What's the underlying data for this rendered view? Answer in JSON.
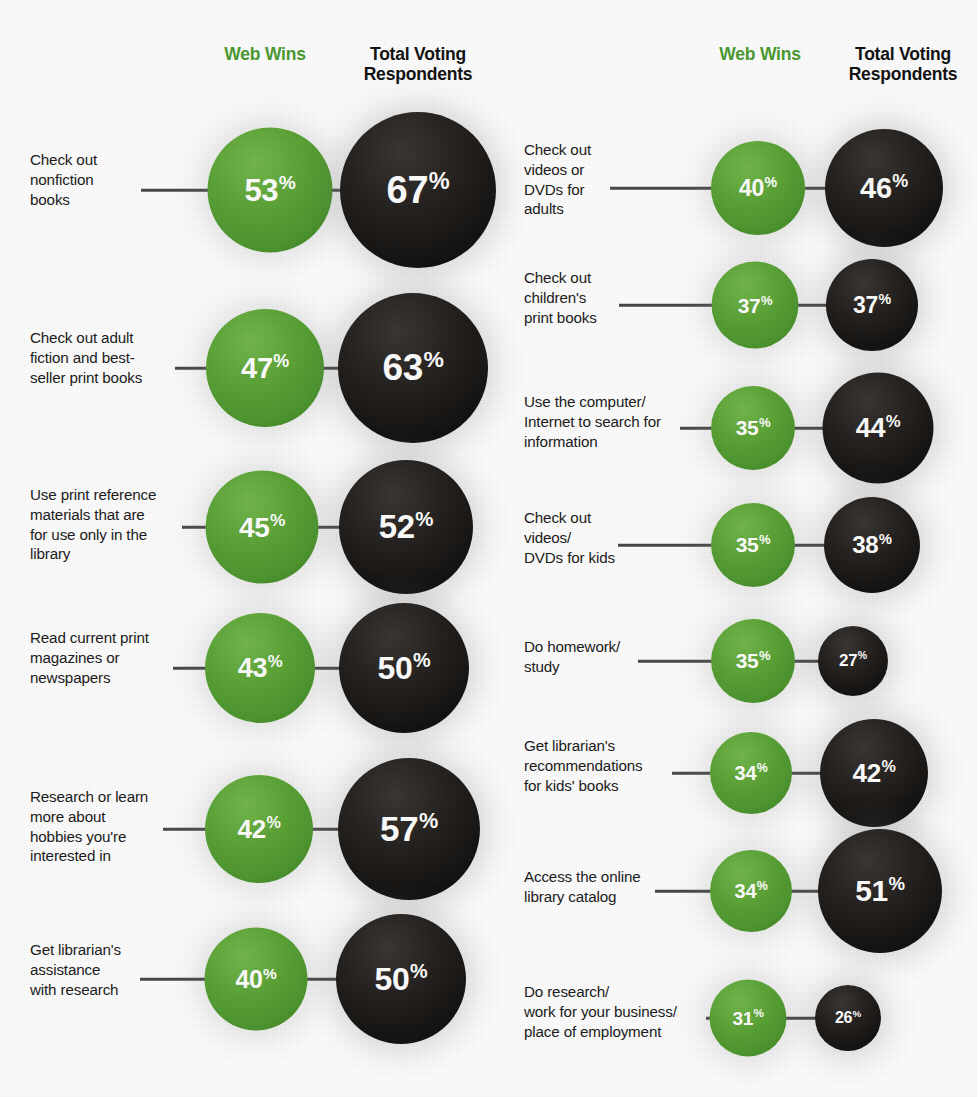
{
  "headers": {
    "web_wins": "Web Wins",
    "total_voting": "Total Voting\nRespondents"
  },
  "colors": {
    "green": "#55a136",
    "black": "#1a1817",
    "label_text": "#1c1c1c",
    "connector": "#4a4a4a",
    "background": "#fefefe",
    "value_text": "#ffffff"
  },
  "percent_symbol": "%",
  "chart_data": {
    "type": "bar",
    "title": "",
    "subtitle": "",
    "xlabel": "",
    "ylabel": "",
    "legend_position": "top",
    "grid": false,
    "series": [
      {
        "name": "Web Wins",
        "color": "#55a136"
      },
      {
        "name": "Total Voting Respondents",
        "color": "#1a1817"
      }
    ],
    "categories": [
      "Check out nonfiction books",
      "Check out adult fiction and best-seller print books",
      "Use print reference materials that are for use only in the library",
      "Read current print magazines or newspapers",
      "Research or learn more about hobbies you're interested in",
      "Get librarian's assistance with research",
      "Check out videos or DVDs for adults",
      "Check out children's print books",
      "Use the computer/Internet to search for information",
      "Check out videos/DVDs for kids",
      "Do homework/study",
      "Get librarian's recommendations for kids' books",
      "Access the online library catalog",
      "Do research/work for your business/place of employment"
    ],
    "web_wins_values": [
      53,
      47,
      45,
      43,
      42,
      40,
      40,
      37,
      35,
      35,
      35,
      34,
      34,
      31
    ],
    "total_voting_values": [
      67,
      63,
      52,
      50,
      57,
      50,
      46,
      37,
      44,
      38,
      27,
      42,
      51,
      26
    ],
    "units": "percent"
  },
  "columns": [
    {
      "id": "left-column",
      "rows": [
        {
          "label": "Check out\nnonfiction\nbooks",
          "web": "53",
          "total": "67",
          "y": 190,
          "label_top": 150,
          "green_cx": 270,
          "green_d": 125,
          "black_cx": 418,
          "black_d": 156,
          "line_x": 141,
          "line_w": 70
        },
        {
          "label": "Check out adult\nfiction and best-\nseller print books",
          "web": "47",
          "total": "63",
          "y": 368,
          "label_top": 328,
          "green_cx": 265,
          "green_d": 118,
          "black_cx": 413,
          "black_d": 150,
          "line_x": 175,
          "line_w": 36
        },
        {
          "label": "Use print reference\nmaterials that are\nfor use only in the\nlibrary",
          "web": "45",
          "total": "52",
          "y": 527,
          "label_top": 485,
          "green_cx": 262,
          "green_d": 113,
          "black_cx": 406,
          "black_d": 134,
          "line_x": 182,
          "line_w": 29
        },
        {
          "label": "Read current print\nmagazines or\nnewspapers",
          "web": "43",
          "total": "50",
          "y": 668,
          "label_top": 628,
          "green_cx": 260,
          "green_d": 110,
          "black_cx": 404,
          "black_d": 130,
          "line_x": 173,
          "line_w": 37
        },
        {
          "label": "Research or learn\nmore about\nhobbies you're\ninterested in",
          "web": "42",
          "total": "57",
          "y": 829,
          "label_top": 787,
          "green_cx": 259,
          "green_d": 108,
          "black_cx": 409,
          "black_d": 142,
          "line_x": 163,
          "line_w": 46
        },
        {
          "label": "Get librarian's\nassistance\nwith research",
          "web": "40",
          "total": "50",
          "y": 979,
          "label_top": 940,
          "green_cx": 256,
          "green_d": 103,
          "black_cx": 401,
          "black_d": 130,
          "line_x": 140,
          "line_w": 70
        }
      ]
    },
    {
      "id": "right-column",
      "rows": [
        {
          "label": "Check out\nvideos or\nDVDs for\nadults",
          "web": "40",
          "total": "46",
          "y": 188,
          "label_top": 140,
          "green_cx": 758,
          "green_d": 94,
          "black_cx": 884,
          "black_d": 118,
          "line_x": 610,
          "line_w": 105
        },
        {
          "label": "Check out\nchildren's\nprint books",
          "web": "37",
          "total": "37",
          "y": 305,
          "label_top": 268,
          "green_cx": 755,
          "green_d": 87,
          "black_cx": 872,
          "black_d": 92,
          "line_x": 619,
          "line_w": 96
        },
        {
          "label": "Use the computer/\nInternet to search for\ninformation",
          "web": "35",
          "total": "44",
          "y": 428,
          "label_top": 392,
          "green_cx": 753,
          "green_d": 84,
          "black_cx": 878,
          "black_d": 111,
          "line_x": 680,
          "line_w": 33
        },
        {
          "label": "Check out\nvideos/\nDVDs for kids",
          "web": "35",
          "total": "38",
          "y": 545,
          "label_top": 508,
          "green_cx": 753,
          "green_d": 84,
          "black_cx": 872,
          "black_d": 96,
          "line_x": 618,
          "line_w": 95
        },
        {
          "label": "Do homework/\nstudy",
          "web": "35",
          "total": "27",
          "y": 661,
          "label_top": 637,
          "green_cx": 753,
          "green_d": 84,
          "black_cx": 853,
          "black_d": 70,
          "line_x": 638,
          "line_w": 75
        },
        {
          "label": "Get librarian's\nrecommendations\nfor kids' books",
          "web": "34",
          "total": "42",
          "y": 773,
          "label_top": 736,
          "green_cx": 751,
          "green_d": 82,
          "black_cx": 874,
          "black_d": 108,
          "line_x": 672,
          "line_w": 42
        },
        {
          "label": "Access the online\nlibrary catalog",
          "web": "34",
          "total": "51",
          "y": 891,
          "label_top": 867,
          "green_cx": 751,
          "green_d": 82,
          "black_cx": 880,
          "black_d": 124,
          "line_x": 655,
          "line_w": 58
        },
        {
          "label": "Do research/\nwork for your business/\nplace of employment",
          "web": "31",
          "total": "26",
          "y": 1018,
          "label_top": 982,
          "green_cx": 748,
          "green_d": 77,
          "black_cx": 848,
          "black_d": 66,
          "line_x": 706,
          "line_w": 8
        }
      ]
    }
  ]
}
